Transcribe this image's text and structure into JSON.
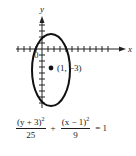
{
  "figure": {
    "axes": {
      "x_label": "x",
      "y_label": "y",
      "origin_label": "0",
      "x_range": [
        -4,
        10
      ],
      "y_range": [
        -10,
        5
      ]
    },
    "ellipse": {
      "center": [
        1,
        -3
      ],
      "semi_axis_x": 3,
      "semi_axis_y": 5
    },
    "center_point": {
      "label": "(1, −3)"
    },
    "equation": {
      "term1_numerator": "(y + 3)",
      "term1_exponent": "2",
      "term1_denominator": "25",
      "plus": "+",
      "term2_numerator": "(x − 1)",
      "term2_exponent": "2",
      "term2_denominator": "9",
      "equals": "= 1"
    }
  }
}
